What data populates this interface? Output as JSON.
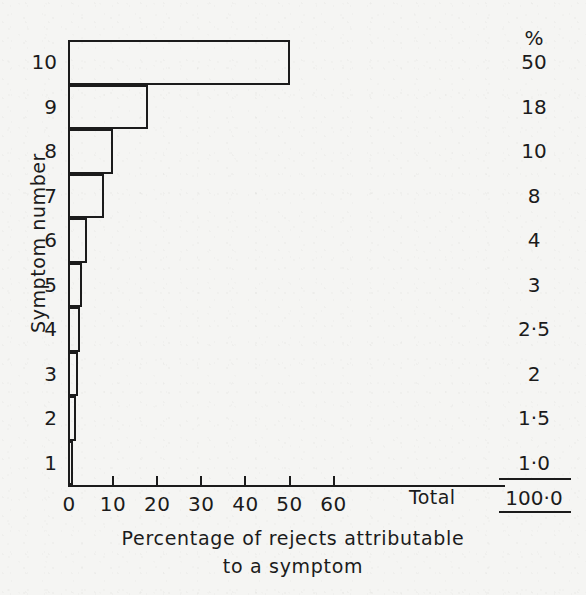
{
  "chart_data": {
    "type": "bar",
    "orientation": "horizontal",
    "title": "",
    "xlabel": "Percentage of rejects attributable to a symptom",
    "xlabel_lines": [
      "Percentage of rejects attributable",
      "to a symptom"
    ],
    "ylabel": "Symptom number",
    "categories": [
      "1",
      "2",
      "3",
      "4",
      "5",
      "6",
      "7",
      "8",
      "9",
      "10"
    ],
    "values": [
      1.0,
      1.5,
      2,
      2.5,
      3,
      4,
      8,
      10,
      18,
      50
    ],
    "xlim": [
      0,
      60
    ],
    "xticks": [
      0,
      10,
      20,
      30,
      40,
      50,
      60
    ],
    "xtick_labels": [
      "0",
      "10",
      "20",
      "30",
      "40",
      "50",
      "60"
    ],
    "grid": false,
    "legend": null,
    "value_column_header": "%",
    "value_column_labels": [
      "1·0",
      "1·5",
      "2",
      "2·5",
      "3",
      "4",
      "8",
      "10",
      "18",
      "50"
    ],
    "total_label": "Total",
    "total_value": "100·0"
  },
  "colors": {
    "background": "#f5f5f3",
    "ink": "#1b1b1b"
  }
}
